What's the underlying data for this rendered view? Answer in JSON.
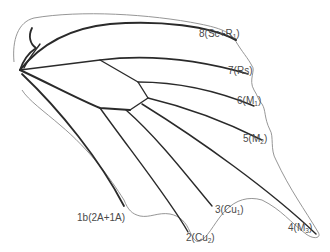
{
  "diagram": {
    "type": "butterfly forewing venation",
    "labels": [
      {
        "id": "v8",
        "number": "8",
        "vein": "Sc+R",
        "sub": "1",
        "text": "8(Sc+R1)"
      },
      {
        "id": "v7",
        "number": "7",
        "vein": "Rs",
        "sub": "",
        "text": "7(Rs)"
      },
      {
        "id": "v6",
        "number": "6",
        "vein": "M",
        "sub": "1",
        "text": "6(M1)"
      },
      {
        "id": "v5",
        "number": "5",
        "vein": "M",
        "sub": "2",
        "text": "5(M2)"
      },
      {
        "id": "v4",
        "number": "4",
        "vein": "M",
        "sub": "3",
        "text": "4(M3)"
      },
      {
        "id": "v3",
        "number": "3",
        "vein": "Cu",
        "sub": "1",
        "text": "3(Cu1)"
      },
      {
        "id": "v2",
        "number": "2",
        "vein": "Cu",
        "sub": "2",
        "text": "2(Cu2)"
      },
      {
        "id": "v1b",
        "number": "1b",
        "vein": "2A+1A",
        "sub": "",
        "text": "1b(2A+1A)"
      }
    ],
    "colors": {
      "vein": "#2a2a2a",
      "margin": "#8a8a8a",
      "label": "#4a4a4a",
      "background": "#ffffff"
    }
  }
}
